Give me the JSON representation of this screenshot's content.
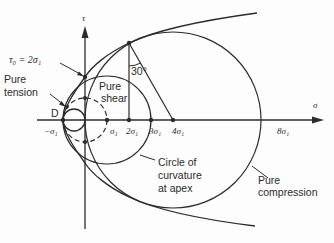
{
  "diagram": {
    "axes": {
      "x_label": "σ",
      "y_label": "τ"
    },
    "ticks": [
      {
        "label": "−σ₁",
        "value": -1
      },
      {
        "label": "σ₁",
        "value": 1
      },
      {
        "label": "2σ₁",
        "value": 2
      },
      {
        "label": "3σ₁",
        "value": 3
      },
      {
        "label": "4σ₁",
        "value": 4
      },
      {
        "label": "8σ₁",
        "value": 8
      }
    ],
    "annotations": {
      "tau0": "τ₀ = 2σ₁",
      "pure_tension_1": "Pure",
      "pure_tension_2": "tension",
      "pure_shear_1": "Pure",
      "pure_shear_2": "shear",
      "point_d": "D",
      "angle": "30°",
      "curvature_1": "Circle of",
      "curvature_2": "curvature",
      "curvature_3": "at apex",
      "pure_compression_1": "Pure",
      "pure_compression_2": "compression"
    },
    "circles": [
      {
        "name": "Pure tension",
        "center": -0.5,
        "radius": 0.5,
        "style": "solid"
      },
      {
        "name": "Pure shear",
        "center": 0,
        "radius": 1,
        "style": "dashed"
      },
      {
        "name": "Circle of curvature at apex",
        "center": 1,
        "radius": 2,
        "style": "solid"
      },
      {
        "name": "Pure compression",
        "center": 4,
        "radius": 4,
        "style": "solid"
      }
    ],
    "envelope": "parabola with vertex at D (−σ₁, 0) passing through τ₀ = 2σ₁"
  }
}
